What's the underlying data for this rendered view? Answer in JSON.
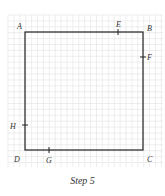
{
  "caption": "Step 5",
  "grid": {
    "x0": 8,
    "y0": 15,
    "x1": 163,
    "y1": 167,
    "spacing": 5.9,
    "color": "#e2e2e2"
  },
  "square": {
    "x": 25,
    "y": 32,
    "size": 118,
    "stroke": "#222222"
  },
  "points": [
    {
      "name": "A",
      "lx": 17,
      "ly": 29
    },
    {
      "name": "B",
      "lx": 147,
      "ly": 31
    },
    {
      "name": "C",
      "lx": 147,
      "ly": 162
    },
    {
      "name": "D",
      "lx": 14,
      "ly": 162
    },
    {
      "name": "E",
      "lx": 116,
      "ly": 27
    },
    {
      "name": "F",
      "lx": 147,
      "ly": 60
    },
    {
      "name": "G",
      "lx": 46,
      "ly": 163
    },
    {
      "name": "H",
      "lx": 10,
      "ly": 129
    }
  ],
  "ticks": [
    {
      "name": "E",
      "side": "top",
      "x": 118,
      "y": 32
    },
    {
      "name": "F",
      "side": "right",
      "x": 143,
      "y": 57
    },
    {
      "name": "G",
      "side": "bottom",
      "x": 49,
      "y": 150
    },
    {
      "name": "H",
      "side": "left",
      "x": 25,
      "y": 125
    }
  ]
}
